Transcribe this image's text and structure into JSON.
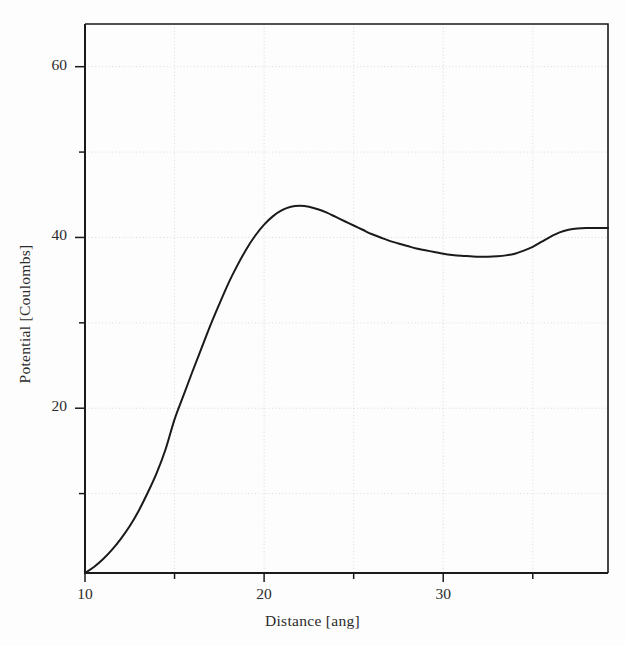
{
  "figure": {
    "background_color": "#fdfdfd",
    "line_color": "#1a1a1a",
    "grid_color": "#cfcfcf",
    "axis_color": "#1a1a1a"
  },
  "axes": {
    "x_title": "Distance [ang]",
    "y_title": "Potential [Coulombs]",
    "x_major_labels": [
      "10",
      "20",
      "30"
    ],
    "y_major_labels": [
      "60",
      "40",
      "20"
    ]
  },
  "chart_data": {
    "type": "line",
    "title": "",
    "subtitle": "",
    "xlabel": "Distance [ang]",
    "ylabel": "Potential [Coulombs]",
    "xlim": [
      10,
      39.2
    ],
    "ylim": [
      0.7,
      65
    ],
    "x_major_ticks": [
      10,
      20,
      30
    ],
    "x_minor_ticks": [
      15,
      25,
      35
    ],
    "y_major_ticks": [
      20,
      40,
      60
    ],
    "y_minor_ticks": [
      10,
      30,
      50
    ],
    "grid": true,
    "grid_style": "dotted",
    "legend": false,
    "legend_position": "none",
    "annotations": [],
    "series": [
      {
        "name": "Potential",
        "color": "#1a1a1a",
        "line_width": 2.0,
        "marker": "none",
        "x": [
          10.0,
          10.5,
          11.0,
          11.5,
          12.0,
          12.5,
          13.0,
          13.5,
          14.0,
          14.5,
          15.0,
          15.5,
          16.0,
          16.5,
          17.0,
          17.5,
          18.0,
          18.5,
          19.0,
          19.5,
          20.0,
          20.5,
          21.0,
          21.5,
          22.0,
          22.5,
          23.0,
          23.5,
          24.0,
          24.5,
          25.0,
          25.5,
          26.0,
          26.5,
          27.0,
          27.5,
          28.0,
          28.5,
          29.0,
          29.5,
          30.0,
          30.5,
          31.0,
          31.5,
          32.0,
          32.5,
          33.0,
          33.5,
          34.0,
          34.5,
          35.0,
          35.5,
          36.0,
          36.5,
          37.0,
          37.5,
          38.0,
          38.5,
          39.2
        ],
        "y": [
          0.7,
          1.4,
          2.3,
          3.4,
          4.7,
          6.2,
          8.0,
          10.1,
          12.4,
          15.2,
          18.7,
          21.5,
          24.3,
          27.0,
          29.7,
          32.2,
          34.6,
          36.7,
          38.6,
          40.2,
          41.5,
          42.5,
          43.2,
          43.6,
          43.7,
          43.6,
          43.3,
          42.9,
          42.4,
          41.9,
          41.4,
          40.9,
          40.4,
          40.0,
          39.6,
          39.3,
          39.0,
          38.7,
          38.5,
          38.3,
          38.1,
          37.95,
          37.85,
          37.8,
          37.75,
          37.75,
          37.8,
          37.9,
          38.1,
          38.45,
          38.9,
          39.5,
          40.1,
          40.6,
          40.9,
          41.05,
          41.1,
          41.1,
          41.1
        ]
      }
    ]
  }
}
